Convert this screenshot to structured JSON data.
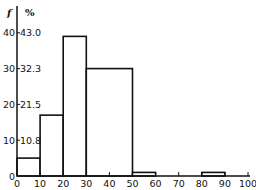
{
  "chart_data": {
    "type": "bar",
    "subtype": "histogram",
    "title": "",
    "xlabel": "",
    "ylabel_left": "f",
    "ylabel_right": "%",
    "bins": [
      {
        "from": 0,
        "to": 10,
        "f": 5
      },
      {
        "from": 10,
        "to": 20,
        "f": 17
      },
      {
        "from": 20,
        "to": 30,
        "f": 39
      },
      {
        "from": 30,
        "to": 50,
        "f": 30
      },
      {
        "from": 50,
        "to": 60,
        "f": 1
      },
      {
        "from": 80,
        "to": 90,
        "f": 1
      }
    ],
    "categories": [
      "0-10",
      "10-20",
      "20-30",
      "30-50",
      "50-60",
      "80-90"
    ],
    "values": [
      5,
      17,
      39,
      30,
      1,
      1
    ],
    "xlim": [
      0,
      100
    ],
    "ylim": [
      0,
      42
    ],
    "x_ticks": [
      "0",
      "10",
      "20",
      "30",
      "40",
      "50",
      "60",
      "70",
      "80",
      "90",
      "100"
    ],
    "y_ticks": [
      {
        "f": "0",
        "pct": ""
      },
      {
        "f": "10",
        "pct": "10.8"
      },
      {
        "f": "20",
        "pct": "21.5"
      },
      {
        "f": "30",
        "pct": "32.3"
      },
      {
        "f": "40",
        "pct": "43.0"
      }
    ],
    "grid": false,
    "legend": "none"
  }
}
